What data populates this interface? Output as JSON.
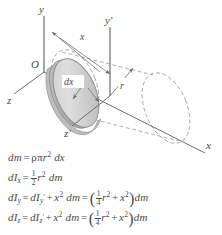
{
  "figure": {
    "type": "physics-diagram",
    "background_color": "#ffffff",
    "line_color": "#6e6e6e",
    "text_color": "#4a4a4a",
    "disk_fill_light": "#dcdcdc",
    "disk_fill_dark": "#c2c2c2",
    "disk_edge_color": "#8a8a8a"
  },
  "axes": [
    {
      "id": "y",
      "label": "y",
      "description": "vertical axis at origin O"
    },
    {
      "id": "z",
      "label": "z",
      "description": "axis toward lower left from origin"
    },
    {
      "id": "x",
      "label": "x",
      "description": "axis toward lower right, cylinder centerline"
    },
    {
      "id": "y-prime",
      "label": "y'",
      "description": "vertical axis through disk centroid"
    },
    {
      "id": "z-prime",
      "label": "z'",
      "description": "axis toward lower left through disk centroid"
    }
  ],
  "origin_label": "O",
  "dimensions": [
    {
      "id": "x-distance",
      "label": "x",
      "description": "distance from origin to disk centroid"
    },
    {
      "id": "dx-thickness",
      "label": "dx",
      "description": "differential thickness of the disk slice"
    },
    {
      "id": "r-radius",
      "label": "r",
      "description": "radius of the disk"
    }
  ],
  "equations": [
    {
      "id": "dm",
      "lhs": "dm",
      "text": "dm = ρπr² dx",
      "parts": {
        "var": "dm",
        "eq": "=",
        "rho": "ρ",
        "pi": "π",
        "r": "r",
        "r_exp": "2",
        "dx": "dx"
      }
    },
    {
      "id": "dIx",
      "lhs": "dIx",
      "text": "dIx = ½ r² dm",
      "parts": {
        "d": "d",
        "I": "I",
        "sub": "x",
        "eq": "=",
        "num": "1",
        "den": "2",
        "r": "r",
        "r_exp": "2",
        "dm": "dm"
      }
    },
    {
      "id": "dIy",
      "lhs": "dIy",
      "text": "dIy = dIy' + x² dm = (¼ r² + x²) dm",
      "parts": {
        "d": "d",
        "I": "I",
        "sub": "y",
        "eq": "=",
        "sub_prime": "y",
        "prime": "'",
        "plus": "+",
        "x": "x",
        "x_exp": "2",
        "dm": "dm",
        "num": "1",
        "den": "4",
        "r": "r",
        "r_exp": "2"
      }
    },
    {
      "id": "dIz",
      "lhs": "dIz",
      "text": "dIz = dIz' + x² dm = (¼ r² + x²) dm",
      "parts": {
        "d": "d",
        "I": "I",
        "sub": "z",
        "eq": "=",
        "sub_prime": "z",
        "prime": "'",
        "plus": "+",
        "x": "x",
        "x_exp": "2",
        "dm": "dm",
        "num": "1",
        "den": "4",
        "r": "r",
        "r_exp": "2"
      }
    }
  ]
}
